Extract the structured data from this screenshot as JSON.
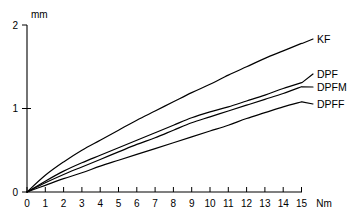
{
  "chart_data": {
    "type": "line",
    "title": "",
    "xlabel": "Nm",
    "ylabel": "mm",
    "xlim": [
      0,
      15
    ],
    "ylim": [
      0,
      2
    ],
    "grid": false,
    "legend_position": "right-inline",
    "x_ticks": [
      "0",
      "1",
      "2",
      "3",
      "4",
      "5",
      "6",
      "7",
      "8",
      "9",
      "10",
      "11",
      "12",
      "13",
      "14",
      "15"
    ],
    "y_ticks": [
      "0",
      "1",
      "2"
    ],
    "x": [
      0,
      1,
      2,
      3,
      4,
      5,
      6,
      7,
      8,
      9,
      10,
      11,
      12,
      13,
      14,
      15
    ],
    "series": [
      {
        "name": "KF",
        "values": [
          0.0,
          0.2,
          0.36,
          0.5,
          0.62,
          0.74,
          0.86,
          0.97,
          1.08,
          1.19,
          1.29,
          1.4,
          1.5,
          1.6,
          1.69,
          1.78
        ]
      },
      {
        "name": "DPF",
        "values": [
          0.0,
          0.13,
          0.25,
          0.35,
          0.44,
          0.53,
          0.62,
          0.71,
          0.8,
          0.89,
          0.96,
          1.02,
          1.09,
          1.16,
          1.24,
          1.31
        ]
      },
      {
        "name": "DPFM",
        "values": [
          0.0,
          0.11,
          0.21,
          0.3,
          0.39,
          0.48,
          0.57,
          0.65,
          0.74,
          0.83,
          0.9,
          0.97,
          1.04,
          1.11,
          1.18,
          1.26
        ]
      },
      {
        "name": "DPFF",
        "values": [
          0.0,
          0.08,
          0.16,
          0.23,
          0.31,
          0.38,
          0.45,
          0.52,
          0.59,
          0.66,
          0.73,
          0.8,
          0.88,
          0.95,
          1.02,
          1.08
        ]
      }
    ]
  },
  "axes": {
    "y_unit": "mm",
    "x_unit": "Nm"
  },
  "labels": {
    "kf": "KF",
    "dpf": "DPF",
    "dpfm": "DPFM",
    "dpff": "DPFF"
  }
}
